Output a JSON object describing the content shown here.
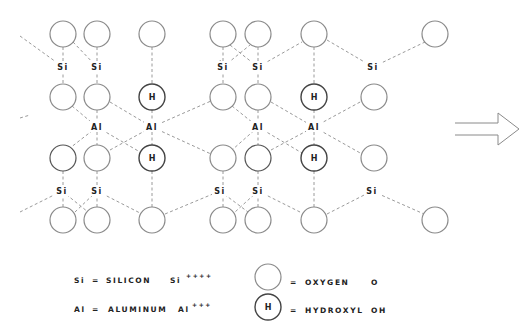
{
  "diagram": {
    "atom_labels": {
      "silicon": "Si",
      "aluminum": "Al",
      "hydroxyl": "H"
    },
    "oxygen_atoms": [
      [
        63,
        34
      ],
      [
        97,
        34
      ],
      [
        152,
        34
      ],
      [
        223,
        34
      ],
      [
        258,
        34
      ],
      [
        314,
        34
      ],
      [
        435,
        34
      ],
      [
        63,
        97
      ],
      [
        97,
        97
      ],
      [
        223,
        97
      ],
      [
        258,
        97
      ],
      [
        374,
        97
      ],
      [
        63,
        158
      ],
      [
        97,
        158
      ],
      [
        223,
        158
      ],
      [
        258,
        158
      ],
      [
        374,
        158
      ],
      [
        63,
        220
      ],
      [
        97,
        220
      ],
      [
        152,
        220
      ],
      [
        223,
        220
      ],
      [
        258,
        220
      ],
      [
        314,
        220
      ],
      [
        435,
        220
      ]
    ],
    "hydroxyl_atoms": [
      [
        152,
        97
      ],
      [
        152,
        158
      ],
      [
        314,
        97
      ],
      [
        314,
        158
      ]
    ],
    "silicon_positions": [
      [
        63,
        67
      ],
      [
        97,
        67
      ],
      [
        223,
        67
      ],
      [
        258,
        67
      ],
      [
        373,
        67
      ],
      [
        62,
        191
      ],
      [
        97,
        191
      ],
      [
        220,
        191
      ],
      [
        258,
        191
      ],
      [
        372,
        191
      ]
    ],
    "aluminum_positions": [
      [
        97,
        127
      ],
      [
        152,
        127
      ],
      [
        258,
        127
      ],
      [
        314,
        127
      ]
    ],
    "arrow": {
      "direction": "right"
    }
  },
  "legend": {
    "si_symbol": "Si",
    "si_eq": "=",
    "si_name": "SILICON",
    "si_ion": "Si",
    "si_charge": "++++",
    "al_symbol": "Al",
    "al_eq": "=",
    "al_name": "ALUMINUM",
    "al_ion": "Al",
    "al_charge": "+++",
    "oxygen_eq": "=",
    "oxygen_name": "OXYGEN",
    "oxygen_symbol": "O",
    "hydroxyl_glyph": "H",
    "hydroxyl_eq": "=",
    "hydroxyl_name": "HYDROXYL",
    "hydroxyl_symbol": "OH"
  }
}
